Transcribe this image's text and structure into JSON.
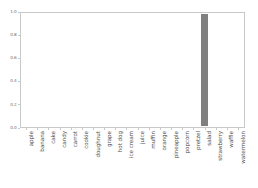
{
  "chart_data": {
    "type": "bar",
    "title": "",
    "subtitle": "",
    "xlabel": "",
    "ylabel": "",
    "categories": [
      "apple",
      "banana",
      "cake",
      "candy",
      "carrot",
      "cookie",
      "doughnut",
      "grape",
      "hot dog",
      "ice cream",
      "juice",
      "muffin",
      "orange",
      "pineapple",
      "popcorn",
      "pretzel",
      "salad",
      "strawberry",
      "waffle",
      "watermelon"
    ],
    "values": [
      0,
      0,
      0,
      0,
      0,
      0,
      0,
      0,
      0,
      0,
      0,
      0,
      0,
      0,
      0,
      0,
      1.0,
      0,
      0,
      0
    ],
    "ylim": [
      0.0,
      1.0
    ],
    "yticks": [
      0.0,
      0.2,
      0.4,
      0.6,
      0.8,
      1.0
    ],
    "ytick_labels": [
      "0.0",
      "0.2",
      "0.4",
      "0.6",
      "0.8",
      "1.0"
    ],
    "grid": false,
    "legend": null,
    "legend_position": "none",
    "bar_color": "#808080",
    "xtick_rotation": 90,
    "annotations": []
  },
  "figure": {
    "background_color": "#ffffff",
    "frame_color": "#c9c9c9",
    "tick_label_color": "#6b6b6b",
    "x_label_color": "#4d4d4d"
  }
}
